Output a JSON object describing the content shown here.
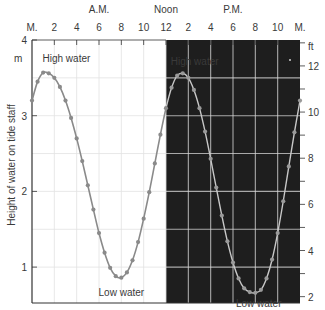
{
  "chart_data": {
    "type": "line",
    "title": "",
    "xlabel": "",
    "ylabel": "Height of water on tide staff",
    "ylabel_left_unit": "m",
    "ylabel_right_unit": "ft",
    "period_labels": [
      {
        "label": "A.M.",
        "hour": 6
      },
      {
        "label": "Noon",
        "hour": 12
      },
      {
        "label": "P.M.",
        "hour": 18
      }
    ],
    "x_ticks": [
      {
        "hour": 0,
        "label": "M."
      },
      {
        "hour": 2,
        "label": "2"
      },
      {
        "hour": 4,
        "label": "4"
      },
      {
        "hour": 6,
        "label": "6"
      },
      {
        "hour": 8,
        "label": "8"
      },
      {
        "hour": 10,
        "label": "10"
      },
      {
        "hour": 12,
        "label": "12"
      },
      {
        "hour": 14,
        "label": "2"
      },
      {
        "hour": 16,
        "label": "4"
      },
      {
        "hour": 18,
        "label": "6"
      },
      {
        "hour": 20,
        "label": "8"
      },
      {
        "hour": 22,
        "label": "10"
      },
      {
        "hour": 24,
        "label": "M."
      }
    ],
    "xlim": [
      0,
      24
    ],
    "ylim_m": [
      0.4,
      4
    ],
    "y_ticks_m": [
      1,
      2,
      3,
      4
    ],
    "y_ticks_ft": [
      2,
      4,
      6,
      8,
      10,
      12
    ],
    "shaded_region": {
      "from_hour": 12,
      "to_hour": 24,
      "meaning": "P.M."
    },
    "grid": true,
    "series": [
      {
        "name": "Tide height (m)",
        "x": [
          0,
          0.5,
          1,
          1.5,
          2,
          2.5,
          3,
          3.5,
          4,
          4.5,
          5,
          5.5,
          6,
          6.5,
          7,
          7.5,
          8,
          8.5,
          9,
          9.5,
          10,
          10.5,
          11,
          11.5,
          12,
          12.5,
          13,
          13.5,
          14,
          14.5,
          15,
          15.5,
          16,
          16.5,
          17,
          17.5,
          18,
          18.5,
          19,
          19.5,
          20,
          20.5,
          21,
          21.5,
          22,
          22.5,
          23,
          23.5,
          24
        ],
        "values": [
          3.2,
          3.45,
          3.57,
          3.56,
          3.5,
          3.38,
          3.2,
          2.97,
          2.7,
          2.4,
          2.08,
          1.76,
          1.45,
          1.19,
          0.99,
          0.88,
          0.86,
          0.93,
          1.09,
          1.33,
          1.64,
          1.99,
          2.37,
          2.75,
          3.1,
          3.37,
          3.53,
          3.56,
          3.5,
          3.34,
          3.1,
          2.79,
          2.43,
          2.05,
          1.68,
          1.34,
          1.06,
          0.85,
          0.72,
          0.67,
          0.66,
          0.7,
          0.85,
          1.1,
          1.45,
          1.87,
          2.33,
          2.78,
          3.2
        ]
      }
    ],
    "annotations": [
      {
        "text": "High water",
        "hour": 1.3,
        "value_m": 3.6
      },
      {
        "text": "Low water",
        "hour": 8,
        "value_m": 0.86
      },
      {
        "text": "High water",
        "hour": 13.5,
        "value_m": 3.56
      },
      {
        "text": "Low water",
        "hour": 20.3,
        "value_m": 0.66
      }
    ]
  },
  "colors": {
    "curve": "#8a8a8a",
    "curve_on_dark": "#c8c8c8",
    "dark_region": "#1e1e1e",
    "grid_light": "#e2e2e2",
    "grid_dark": "#d8d8d8",
    "axis": "#333333",
    "text": "#3a3a3a"
  }
}
